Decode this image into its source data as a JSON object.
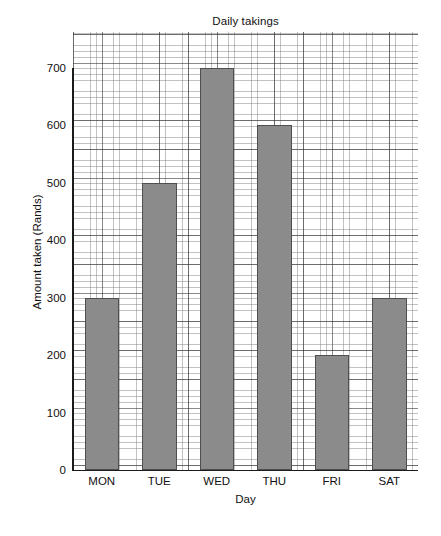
{
  "chart_data": {
    "type": "bar",
    "title": "Daily takings",
    "xlabel": "Day",
    "ylabel": "Amount taken (Rands)",
    "categories": [
      "MON",
      "TUE",
      "WED",
      "THU",
      "FRI",
      "SAT"
    ],
    "values": [
      300,
      500,
      700,
      600,
      200,
      300
    ],
    "ylim": [
      0,
      740
    ],
    "yticks": [
      0,
      100,
      200,
      300,
      400,
      500,
      600,
      700
    ],
    "ytick_labels": [
      "0",
      "100",
      "200",
      "300",
      "400",
      "500",
      "600",
      "700"
    ],
    "grid": true,
    "grid_minor_step": 20,
    "grid_major_step": 100,
    "legend": null,
    "bar_color": "#8b8b8b",
    "bar_edge_color": "#4f4f4f",
    "axis_color": "#1b1b1b",
    "grid_color": "#6e6e6e",
    "background_color": "#ffffff"
  }
}
